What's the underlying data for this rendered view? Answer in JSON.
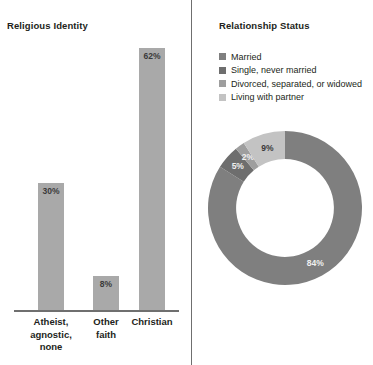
{
  "colors": {
    "background": "#ffffff",
    "divider": "#6f6f6f",
    "bar_fill": "#a9a9a9",
    "axis": "#6f6f6f",
    "text": "#231f20",
    "value_text": "#3a3a3a",
    "series_married": "#7f7f7f",
    "series_single": "#6e6e6e",
    "series_divorced": "#c3c3c3",
    "series_partner": "#9e9e9e",
    "label_on_dark": "#f0f0f0",
    "label_on_light": "#3a3a3a"
  },
  "bar_panel": {
    "title": "Religious Identity"
  },
  "donut_panel": {
    "title": "Relationship Status",
    "legend": [
      {
        "label": "Married",
        "color": "#7f7f7f"
      },
      {
        "label": "Single, never married",
        "color": "#6e6e6e"
      },
      {
        "label": "Divorced, separated, or widowed",
        "color": "#9e9e9e"
      },
      {
        "label": "Living with partner",
        "color": "#c3c3c3"
      }
    ]
  },
  "chart_data": [
    {
      "type": "bar",
      "title": "Religious Identity",
      "xlabel": "",
      "ylabel": "",
      "ylim": [
        0,
        70
      ],
      "grid": false,
      "legend": "none",
      "categories": [
        "Atheist, agnostic, none",
        "Other faith",
        "Christian"
      ],
      "category_lines": [
        [
          "Atheist,",
          "agnostic,",
          "none"
        ],
        [
          "Other",
          "faith"
        ],
        [
          "Christian"
        ]
      ],
      "values": [
        30,
        8,
        62
      ],
      "value_labels": [
        "30%",
        "8%",
        "62%"
      ],
      "bar_color": "#a9a9a9"
    },
    {
      "type": "pie",
      "subtype": "donut",
      "title": "Relationship Status",
      "legend": "top",
      "labels": [
        "Married",
        "Single, never married",
        "Divorced, separated, or widowed",
        "Living with partner"
      ],
      "values": [
        84,
        5,
        2,
        9
      ],
      "value_labels": [
        "84%",
        "5%",
        "2%",
        "9%"
      ],
      "colors": [
        "#7f7f7f",
        "#6e6e6e",
        "#9e9e9e",
        "#c3c3c3"
      ],
      "start_angle_deg": 0,
      "direction": "clockwise",
      "inner_radius_ratio": 0.635
    }
  ]
}
